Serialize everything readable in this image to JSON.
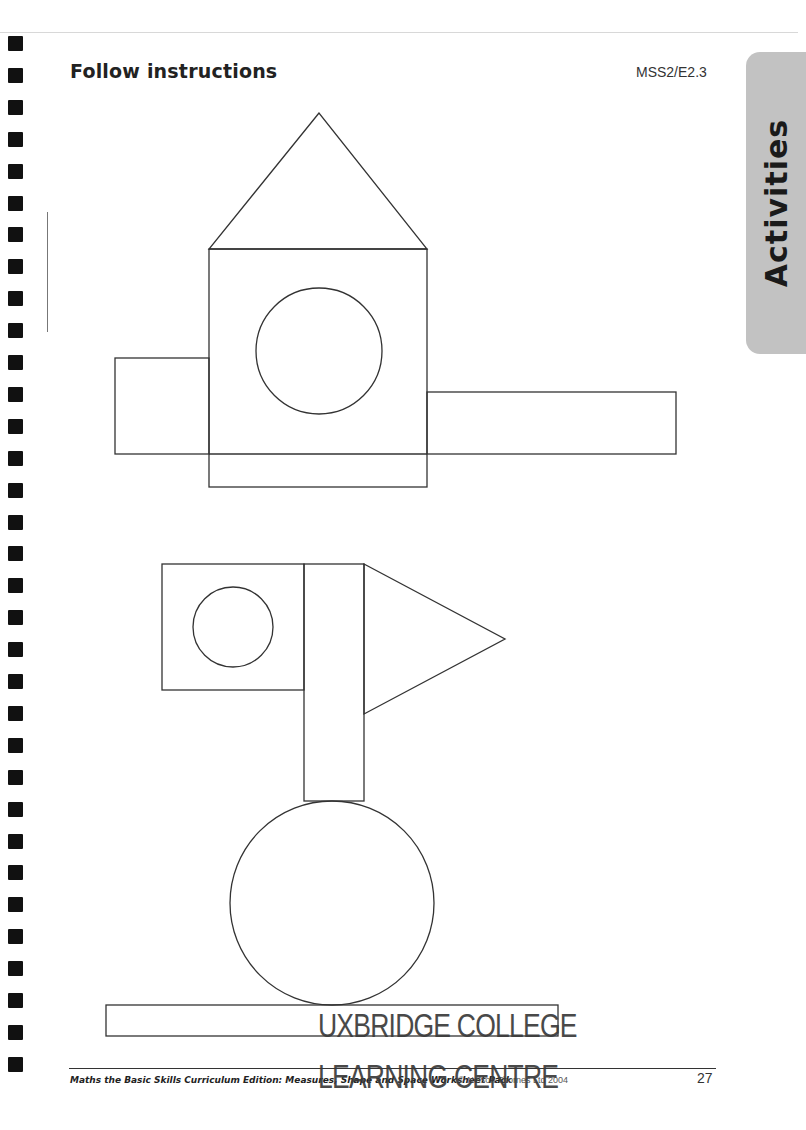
{
  "page": {
    "title": "Follow instructions",
    "code": "MSS2/E2.3",
    "side_tab": "Activities",
    "page_number": "27",
    "tab_color": "#c2c2c2"
  },
  "footer": {
    "book_title": "Maths the Basic Skills Curriculum Edition: Measures, Shape and Space Worksheet Pack",
    "copyright": "© Nelson Thornes Ltd 2004"
  },
  "stamp": {
    "line1": "UXBRIDGE COLLEGE",
    "line2": "LEARNING CENTRE"
  },
  "binding_holes": {
    "count": 33,
    "start_y": 36,
    "spacing": 31.9
  },
  "figures": [
    {
      "name": "figure-1",
      "shapes": [
        {
          "type": "triangle",
          "points": "319,113 209,249 427,249"
        },
        {
          "type": "rect",
          "x": 209,
          "y": 249,
          "w": 218,
          "h": 238
        },
        {
          "type": "circle",
          "cx": 319,
          "cy": 351,
          "r": 63
        },
        {
          "type": "rect",
          "x": 115,
          "y": 358,
          "w": 94,
          "h": 96
        },
        {
          "type": "rect",
          "x": 427,
          "y": 392,
          "w": 249,
          "h": 62
        },
        {
          "type": "line",
          "x1": 209,
          "y1": 454,
          "x2": 427,
          "y2": 454
        }
      ]
    },
    {
      "name": "figure-2",
      "shapes": [
        {
          "type": "rect",
          "x": 162,
          "y": 564,
          "w": 142,
          "h": 126
        },
        {
          "type": "circle",
          "cx": 233,
          "cy": 627,
          "r": 40
        },
        {
          "type": "rect",
          "x": 304,
          "y": 564,
          "w": 60,
          "h": 237
        },
        {
          "type": "triangle",
          "points": "364,564 505,639 364,714"
        },
        {
          "type": "circle",
          "cx": 332,
          "cy": 903,
          "r": 102
        },
        {
          "type": "rect",
          "x": 106,
          "y": 1005,
          "w": 452,
          "h": 31
        }
      ]
    }
  ]
}
